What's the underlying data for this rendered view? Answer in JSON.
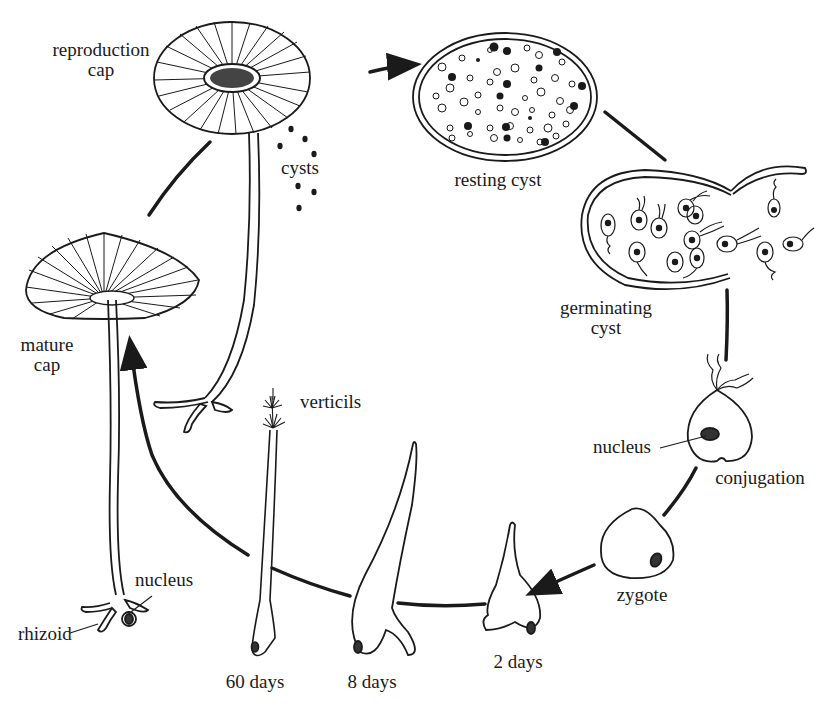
{
  "diagram": {
    "stages": [
      {
        "id": "reproduction-cap",
        "label_line1": "reproduction",
        "label_line2": "cap"
      },
      {
        "id": "cysts",
        "label": "cysts"
      },
      {
        "id": "resting-cyst",
        "label": "resting cyst"
      },
      {
        "id": "germinating-cyst",
        "label_line1": "germinating",
        "label_line2": "cyst"
      },
      {
        "id": "conjugation",
        "label": "conjugation",
        "nucleus_label": "nucleus"
      },
      {
        "id": "zygote",
        "label": "zygote"
      },
      {
        "id": "2-days",
        "label": "2 days"
      },
      {
        "id": "8-days",
        "label": "8 days"
      },
      {
        "id": "60-days",
        "label": "60 days",
        "feature_label": "verticils"
      },
      {
        "id": "mature-cap",
        "label_line1": "mature",
        "label_line2": "cap",
        "nucleus_label": "nucleus",
        "rhizoid_label": "rhizoid"
      }
    ],
    "cycle_direction": "clockwise",
    "colors": {
      "ink": "#1a1a1a",
      "background": "#ffffff"
    }
  }
}
